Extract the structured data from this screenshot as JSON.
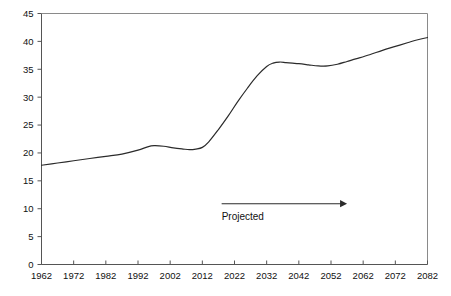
{
  "chart_data": {
    "type": "line",
    "title": "",
    "subtitle": "",
    "xlabel": "",
    "ylabel": "",
    "xlim": [
      1962,
      2082
    ],
    "ylim": [
      0,
      45
    ],
    "grid": false,
    "legend": "none",
    "x_ticks": [
      "1962",
      "1972",
      "1982",
      "1992",
      "2002",
      "2012",
      "2022",
      "2032",
      "2042",
      "2052",
      "2062",
      "2072",
      "2082"
    ],
    "y_ticks": [
      "0",
      "5",
      "10",
      "15",
      "20",
      "25",
      "30",
      "35",
      "40",
      "45"
    ],
    "x_tick_values": [
      1962,
      1972,
      1982,
      1992,
      2002,
      2012,
      2022,
      2032,
      2042,
      2052,
      2062,
      2072,
      2082
    ],
    "y_tick_values": [
      0,
      5,
      10,
      15,
      20,
      25,
      30,
      35,
      40,
      45
    ],
    "series": [
      {
        "name": "value",
        "x": [
          1962,
          1967,
          1972,
          1977,
          1982,
          1987,
          1992,
          1995,
          1997,
          2000,
          2003,
          2006,
          2008,
          2010,
          2012,
          2014,
          2017,
          2020,
          2023,
          2026,
          2029,
          2032,
          2034,
          2036,
          2038,
          2040,
          2042,
          2045,
          2048,
          2051,
          2054,
          2057,
          2060,
          2064,
          2068,
          2072,
          2076,
          2079,
          2082
        ],
        "values": [
          17.8,
          18.2,
          18.6,
          19.0,
          19.4,
          19.8,
          20.5,
          21.1,
          21.3,
          21.2,
          20.9,
          20.7,
          20.6,
          20.7,
          21.0,
          22.0,
          24.2,
          26.6,
          29.2,
          31.6,
          33.8,
          35.5,
          36.1,
          36.3,
          36.2,
          36.1,
          36.0,
          35.8,
          35.6,
          35.6,
          35.9,
          36.4,
          36.9,
          37.6,
          38.4,
          39.1,
          39.8,
          40.3,
          40.7
        ]
      }
    ],
    "annotations": [
      {
        "id": "projected",
        "label": "Projected",
        "arrow": "right",
        "arrow_x_start": 2018,
        "arrow_x_end": 2057,
        "arrow_y": 10.9,
        "label_y": 8.0
      }
    ],
    "colors": {
      "line": "#2b2b2b",
      "axis": "#555555",
      "frame": "#8a8a8a",
      "text": "#111111",
      "background": "#ffffff"
    }
  }
}
